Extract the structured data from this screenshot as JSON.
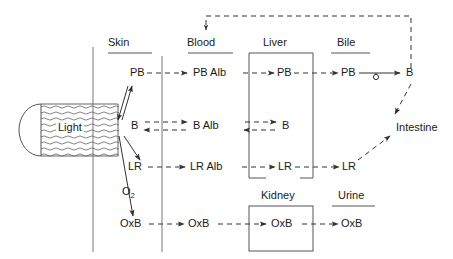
{
  "diagram": {
    "colors": {
      "stroke": "#333333",
      "text": "#1a1a1a",
      "light_stroke": "#555555",
      "background": "#ffffff"
    },
    "compartments": [
      {
        "id": "skin",
        "label": "Skin",
        "x": 120,
        "y": 43,
        "underline": true,
        "box": false
      },
      {
        "id": "blood",
        "label": "Blood",
        "x": 206,
        "y": 43,
        "underline": true,
        "box": false
      },
      {
        "id": "liver",
        "label": "Liver",
        "x": 277,
        "y": 43,
        "underline": false,
        "box": true
      },
      {
        "id": "bile",
        "label": "Bile",
        "x": 347,
        "y": 43,
        "underline": true,
        "box": false
      },
      {
        "id": "kidney",
        "label": "Kidney",
        "x": 283,
        "y": 196,
        "underline": false,
        "box": true
      },
      {
        "id": "urine",
        "label": "Urine",
        "x": 350,
        "y": 196,
        "underline": true,
        "box": false
      }
    ],
    "nodes": [
      {
        "id": "light",
        "label": "Light",
        "x": 54,
        "y": 128,
        "row": "bilirubin"
      },
      {
        "id": "skin-pb",
        "label": "PB",
        "x": 133,
        "y": 76,
        "row": "photobilirubin"
      },
      {
        "id": "blood-pbalb",
        "label": "PB Alb",
        "x": 213,
        "y": 76,
        "row": "photobilirubin"
      },
      {
        "id": "liver-pb",
        "label": "PB",
        "x": 283,
        "y": 76,
        "row": "photobilirubin"
      },
      {
        "id": "bile-pb",
        "label": "PB",
        "x": 348,
        "y": 76,
        "row": "photobilirubin"
      },
      {
        "id": "gut-b",
        "label": "B",
        "x": 409,
        "y": 76,
        "row": "photobilirubin"
      },
      {
        "id": "skin-b",
        "label": "B",
        "x": 133,
        "y": 128,
        "row": "bilirubin"
      },
      {
        "id": "blood-balb",
        "label": "B Alb",
        "x": 213,
        "y": 128,
        "row": "bilirubin"
      },
      {
        "id": "liver-b",
        "label": "B",
        "x": 285,
        "y": 128,
        "row": "bilirubin"
      },
      {
        "id": "skin-lr",
        "label": "LR",
        "x": 134,
        "y": 170,
        "row": "lumirubin"
      },
      {
        "id": "blood-lralb",
        "label": "LR Alb",
        "x": 211,
        "y": 170,
        "row": "lumirubin"
      },
      {
        "id": "liver-lr",
        "label": "LR",
        "x": 284,
        "y": 170,
        "row": "lumirubin"
      },
      {
        "id": "bile-lr",
        "label": "LR",
        "x": 349,
        "y": 170,
        "row": "lumirubin"
      },
      {
        "id": "oxygen",
        "label": "O",
        "sublabel": "2",
        "x": 127,
        "y": 192,
        "row": "oxidation"
      },
      {
        "id": "skin-oxb",
        "label": "OxB",
        "x": 129,
        "y": 227,
        "row": "oxidation"
      },
      {
        "id": "blood-oxb",
        "label": "OxB",
        "x": 197,
        "y": 227,
        "row": "oxidation"
      },
      {
        "id": "kidney-oxb",
        "label": "OxB",
        "x": 281,
        "y": 227,
        "row": "oxidation"
      },
      {
        "id": "urine-oxb",
        "label": "OxB",
        "x": 350,
        "y": 227,
        "row": "oxidation"
      },
      {
        "id": "intestine",
        "label": "Intestine",
        "x": 411,
        "y": 128,
        "row": "excretion"
      }
    ],
    "edges": [
      {
        "id": "e-skinb-to-skinpb",
        "from": "skin-b",
        "to": "skin-pb",
        "style": "solid",
        "direction": "forward"
      },
      {
        "id": "e-skinpb-to-skinb",
        "from": "skin-pb",
        "to": "skin-b",
        "style": "solid",
        "direction": "forward"
      },
      {
        "id": "e-skinb-to-skinlr",
        "from": "skin-b",
        "to": "skin-lr",
        "style": "solid",
        "direction": "forward"
      },
      {
        "id": "e-skinb-to-skinoxb",
        "from": "skin-b",
        "to": "skin-oxb",
        "style": "solid",
        "direction": "forward"
      },
      {
        "id": "e-skinpb-to-pbalb",
        "from": "skin-pb",
        "to": "blood-pbalb",
        "style": "dashed",
        "direction": "forward"
      },
      {
        "id": "e-pbalb-to-liverpb",
        "from": "blood-pbalb",
        "to": "liver-pb",
        "style": "dashed",
        "direction": "forward"
      },
      {
        "id": "e-liverpb-to-bilepb",
        "from": "liver-pb",
        "to": "bile-pb",
        "style": "dashed",
        "direction": "forward"
      },
      {
        "id": "e-bilepb-to-gutb",
        "from": "bile-pb",
        "to": "gut-b",
        "style": "solid",
        "direction": "forward",
        "marker": "circle"
      },
      {
        "id": "e-skinb-balb",
        "from": "skin-b",
        "to": "blood-balb",
        "style": "dashed",
        "direction": "both"
      },
      {
        "id": "e-balb-liverb",
        "from": "blood-balb",
        "to": "liver-b",
        "style": "dashed",
        "direction": "both"
      },
      {
        "id": "e-skinlr-lralb",
        "from": "skin-lr",
        "to": "blood-lralb",
        "style": "dashed",
        "direction": "forward"
      },
      {
        "id": "e-lralb-liverlr",
        "from": "blood-lralb",
        "to": "liver-lr",
        "style": "dashed",
        "direction": "forward"
      },
      {
        "id": "e-liverlr-bilelr",
        "from": "liver-lr",
        "to": "bile-lr",
        "style": "dashed",
        "direction": "forward"
      },
      {
        "id": "e-skinoxb-bloodoxb",
        "from": "skin-oxb",
        "to": "blood-oxb",
        "style": "dashed",
        "direction": "forward"
      },
      {
        "id": "e-bloodoxb-kidneyoxb",
        "from": "blood-oxb",
        "to": "kidney-oxb",
        "style": "dashed",
        "direction": "forward"
      },
      {
        "id": "e-kidneyoxb-urineoxb",
        "from": "kidney-oxb",
        "to": "urine-oxb",
        "style": "dashed",
        "direction": "forward"
      },
      {
        "id": "e-gutb-intestine",
        "from": "gut-b",
        "to": "intestine",
        "style": "dashed",
        "direction": "forward"
      },
      {
        "id": "e-bilelr-intestine",
        "from": "bile-lr",
        "to": "intestine",
        "style": "dashed",
        "direction": "forward"
      },
      {
        "id": "e-enterohepatic",
        "from": "gut-b",
        "to": "blood-pbalb",
        "style": "dashed",
        "direction": "forward",
        "route": "up-over-down"
      }
    ]
  }
}
